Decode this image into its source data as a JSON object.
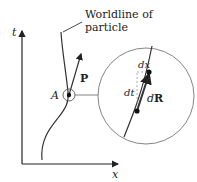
{
  "diagram": {
    "axes": {
      "vertical_label": "t",
      "horizontal_label": "x"
    },
    "annotation": {
      "line1": "Worldline of",
      "line2": "particle"
    },
    "point_label": "A",
    "vector_label": "P",
    "inset": {
      "dx_label": "dx",
      "dt_label": "dt",
      "dR_label_d": "d",
      "dR_label_R": "R"
    },
    "colors": {
      "stroke": "#333333",
      "circle": "#777777",
      "dashed": "#999999"
    }
  }
}
